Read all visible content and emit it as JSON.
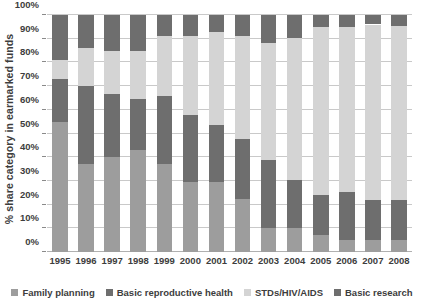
{
  "chart_data": {
    "type": "bar",
    "subtype": "stacked-bar-100-percent",
    "title": "",
    "xlabel": "",
    "ylabel": "% share category in earmarked funds",
    "ylim": [
      0,
      100
    ],
    "yunit": "%",
    "grid": true,
    "legend_position": "bottom",
    "categories": [
      "1995",
      "1996",
      "1997",
      "1998",
      "1999",
      "2000",
      "2001",
      "2002",
      "2003",
      "2004",
      "2005",
      "2006",
      "2007",
      "2008"
    ],
    "ytick_labels": [
      "0%",
      "10%",
      "20%",
      "30%",
      "40%",
      "50%",
      "60%",
      "70%",
      "80%",
      "90%",
      "100%"
    ],
    "ytick_values": [
      0,
      10,
      20,
      30,
      40,
      50,
      60,
      70,
      80,
      90,
      100
    ],
    "series": [
      {
        "name": "Family planning",
        "color": "#9d9d9d",
        "values": [
          55,
          37,
          40,
          43,
          37,
          29.5,
          29.5,
          22.5,
          10,
          10,
          7,
          5,
          5,
          5
        ]
      },
      {
        "name": "Basic reproductive health",
        "color": "#6e6e6e",
        "values": [
          18,
          33,
          26.5,
          21.5,
          29,
          28.5,
          24,
          25,
          29,
          20.5,
          17,
          20.5,
          17,
          17
        ]
      },
      {
        "name": "STDs/HIV/AIDS",
        "color": "#d4d4d4",
        "values": [
          8,
          16,
          18.5,
          20.5,
          25,
          33,
          39.5,
          43.5,
          49,
          60,
          71,
          69.5,
          74,
          73.5
        ]
      },
      {
        "name": "Basic research",
        "color": "#6e6e6e",
        "values": [
          19,
          14,
          15,
          15,
          9,
          9,
          7,
          9,
          12,
          9.5,
          5,
          5,
          4,
          4.5
        ]
      }
    ],
    "cumulative_tops": {
      "1995": [
        55,
        73,
        81,
        100
      ],
      "1996": [
        37,
        70,
        86,
        100
      ],
      "1997": [
        40,
        66.5,
        85,
        100
      ],
      "1998": [
        43,
        64.5,
        85,
        100
      ],
      "1999": [
        37,
        66,
        91,
        100
      ],
      "2000": [
        29.5,
        58,
        91,
        100
      ],
      "2001": [
        29.5,
        53.5,
        93,
        100
      ],
      "2002": [
        22.5,
        47.5,
        91,
        100
      ],
      "2003": [
        10,
        39,
        88,
        100
      ],
      "2004": [
        10,
        30.5,
        90.5,
        100
      ],
      "2005": [
        7,
        24,
        95,
        100
      ],
      "2006": [
        5,
        25.5,
        95,
        100
      ],
      "2007": [
        5,
        22,
        96,
        100
      ],
      "2008": [
        5,
        22,
        95.5,
        100
      ]
    }
  },
  "legend": {
    "items": [
      {
        "label": "Family planning",
        "color": "#9d9d9d"
      },
      {
        "label": "Basic reproductive health",
        "color": "#6e6e6e"
      },
      {
        "label": "STDs/HIV/AIDS",
        "color": "#d4d4d4"
      },
      {
        "label": "Basic research",
        "color": "#6e6e6e"
      }
    ]
  },
  "colors": {
    "background": "#ffffff",
    "gridline": "#c9c9c9",
    "text": "#3d3d3d",
    "family_planning": "#9d9d9d",
    "basic_reproductive_health": "#6e6e6e",
    "stds_hiv_aids": "#d4d4d4",
    "basic_research": "#6e6e6e"
  }
}
